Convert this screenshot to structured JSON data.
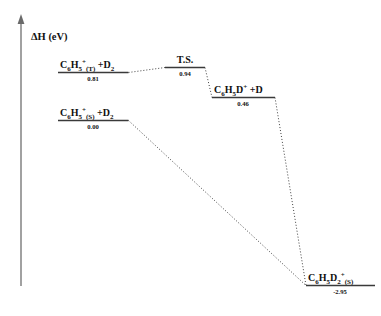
{
  "figure": {
    "type": "energy-profile-diagram",
    "axis": {
      "label": "ΔH (eV)",
      "orientation": "vertical",
      "arrow": "up"
    },
    "levels": [
      {
        "id": "triplet-reactant",
        "name": "triplet-reactant-level",
        "formula_parts": [
          {
            "text": "C",
            "style": "normal"
          },
          {
            "text": "6",
            "style": "sub"
          },
          {
            "text": "H",
            "style": "normal"
          },
          {
            "text": "5",
            "style": "sub"
          },
          {
            "text": "+",
            "style": "sup"
          },
          {
            "text": "(T)",
            "style": "sub"
          },
          {
            "text": " +D",
            "style": "normal"
          },
          {
            "text": "2",
            "style": "sub"
          }
        ],
        "plain_label": "C6H5+(T) +D2",
        "value": "0.81",
        "energy": 0.81
      },
      {
        "id": "transition-state",
        "name": "transition-state-level",
        "formula_parts": [
          {
            "text": "T.S.",
            "style": "normal"
          }
        ],
        "plain_label": "T.S.",
        "value": "0.94",
        "energy": 0.94
      },
      {
        "id": "intermediate-product",
        "name": "intermediate-product-level",
        "formula_parts": [
          {
            "text": "C",
            "style": "normal"
          },
          {
            "text": "6",
            "style": "sub"
          },
          {
            "text": "H",
            "style": "normal"
          },
          {
            "text": "5",
            "style": "sub"
          },
          {
            "text": "D",
            "style": "normal"
          },
          {
            "text": "+",
            "style": "sup"
          },
          {
            "text": " +D",
            "style": "normal"
          }
        ],
        "plain_label": "C6H5D+ +D",
        "value": "0.46",
        "energy": 0.46
      },
      {
        "id": "singlet-reactant",
        "name": "singlet-reactant-level",
        "formula_parts": [
          {
            "text": "C",
            "style": "normal"
          },
          {
            "text": "6",
            "style": "sub"
          },
          {
            "text": "H",
            "style": "normal"
          },
          {
            "text": "5",
            "style": "sub"
          },
          {
            "text": "+",
            "style": "sup"
          },
          {
            "text": "(S)",
            "style": "sub"
          },
          {
            "text": " +D",
            "style": "normal"
          },
          {
            "text": "2",
            "style": "sub"
          }
        ],
        "plain_label": "C6H5+(S) +D2",
        "value": "0.00",
        "energy": 0.0
      },
      {
        "id": "final-product",
        "name": "final-product-level",
        "formula_parts": [
          {
            "text": "C",
            "style": "normal"
          },
          {
            "text": "6",
            "style": "sub"
          },
          {
            "text": "H",
            "style": "normal"
          },
          {
            "text": "5",
            "style": "sub"
          },
          {
            "text": "D",
            "style": "normal"
          },
          {
            "text": "2",
            "style": "sub"
          },
          {
            "text": "+",
            "style": "sup"
          },
          {
            "text": "(S)",
            "style": "sub"
          }
        ],
        "plain_label": "C6H5D2+(S)",
        "value": "-2.95",
        "energy": -2.95
      }
    ],
    "connectors": [
      {
        "from": "triplet-reactant",
        "to": "transition-state",
        "name": "connector-triplet-to-ts"
      },
      {
        "from": "transition-state",
        "to": "intermediate-product",
        "name": "connector-ts-to-intermediate"
      },
      {
        "from": "intermediate-product",
        "to": "final-product",
        "name": "connector-intermediate-to-product"
      },
      {
        "from": "singlet-reactant",
        "to": "final-product",
        "name": "connector-singlet-to-product"
      }
    ],
    "colors": {
      "level_line": "#3a3a3a",
      "connector": "#2a2a2a",
      "axis": "#8a8a8a",
      "text": "#111111",
      "background": "#ffffff"
    }
  },
  "chart_data": {
    "type": "line",
    "title": "",
    "xlabel": "",
    "ylabel": "ΔH (eV)",
    "categories": [
      "C6H5+(T) +D2",
      "T.S.",
      "C6H5D+ +D",
      "C6H5+(S) +D2",
      "C6H5D2+(S)"
    ],
    "values": [
      0.81,
      0.94,
      0.46,
      0.0,
      -2.95
    ],
    "series": [
      {
        "name": "triplet pathway",
        "points": [
          {
            "label": "C6H5+(T) +D2",
            "value": 0.81
          },
          {
            "label": "T.S.",
            "value": 0.94
          },
          {
            "label": "C6H5D+ +D",
            "value": 0.46
          },
          {
            "label": "C6H5D2+(S)",
            "value": -2.95
          }
        ]
      },
      {
        "name": "singlet pathway",
        "points": [
          {
            "label": "C6H5+(S) +D2",
            "value": 0.0
          },
          {
            "label": "C6H5D2+(S)",
            "value": -2.95
          }
        ]
      }
    ],
    "ylim": [
      -2.95,
      0.94
    ],
    "grid": false,
    "legend": "none"
  }
}
